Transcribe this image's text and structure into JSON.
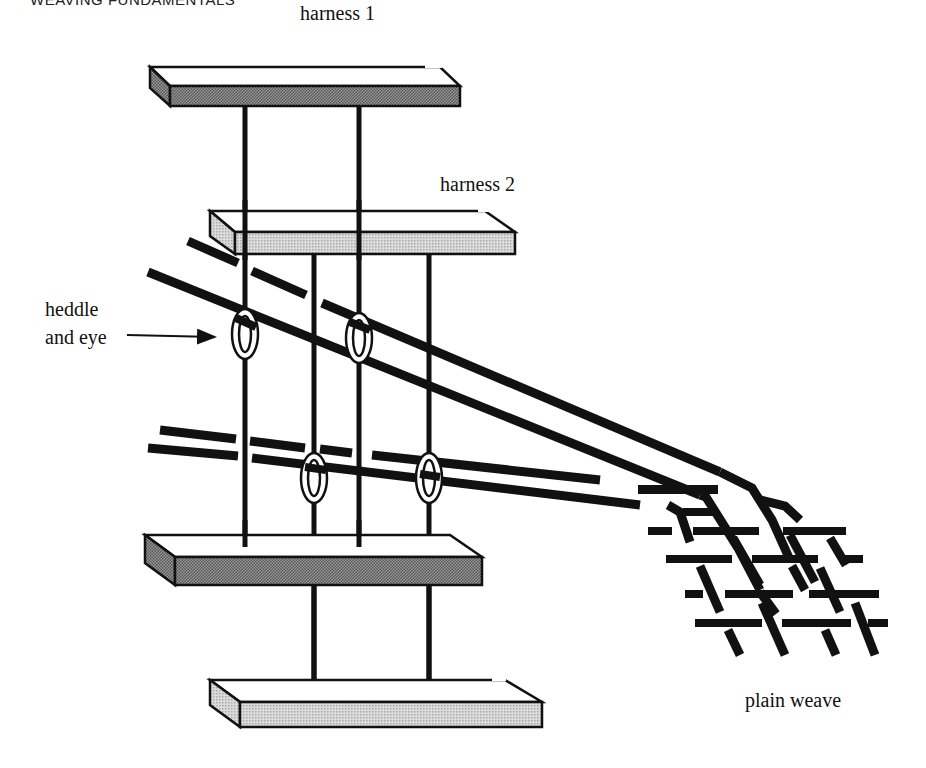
{
  "page": {
    "running_header": "WEAVING FUNDAMENTALS"
  },
  "diagram": {
    "labels": {
      "harness_1": "harness 1",
      "harness_2": "harness 2",
      "heddle_line1": "heddle",
      "heddle_line2": "and eye",
      "plain_weave": "plain weave"
    },
    "components": [
      {
        "id": "harness-1-top-bar",
        "shade": "dark"
      },
      {
        "id": "harness-2-top-bar",
        "shade": "light"
      },
      {
        "id": "harness-1-bottom-bar",
        "shade": "dark"
      },
      {
        "id": "harness-2-bottom-bar",
        "shade": "light"
      },
      {
        "id": "heddles",
        "count": 4
      },
      {
        "id": "warp-threads",
        "count": 4
      },
      {
        "id": "woven-cloth",
        "pattern": "plain weave"
      }
    ],
    "colors": {
      "ink": "#111111",
      "dark_shade": "#7a7a7a",
      "light_shade": "#c4c4c4",
      "paper": "#ffffff"
    }
  }
}
